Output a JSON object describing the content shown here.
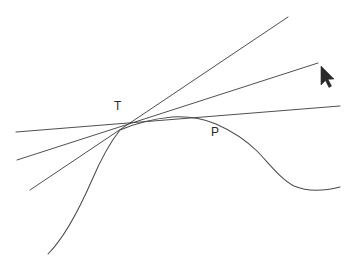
{
  "figure": {
    "background_color": "#ffffff",
    "stroke_color": "#3b3b3b",
    "curve_color": "#4a4a4a",
    "label_color": "#2a2a2a",
    "labels": {
      "tangent_point": "T",
      "secant_point": "P"
    },
    "points": {
      "T": {
        "x": 120,
        "y": 130
      },
      "P": {
        "x": 212,
        "y": 120
      }
    },
    "lines": [
      {
        "name": "steep-secant-line",
        "x1": 30,
        "y1": 190,
        "x2": 288,
        "y2": 17
      },
      {
        "name": "middle-secant-line",
        "x1": 17,
        "y1": 160,
        "x2": 318,
        "y2": 63
      },
      {
        "name": "tangent-line",
        "x1": 16,
        "y1": 132,
        "x2": 340,
        "y2": 106
      }
    ],
    "curve": {
      "name": "function-curve",
      "path": "M 48 254 C 62 240 78 212 92 180 C 104 152 112 140 120 130 C 134 124 152 119 172 117 C 190 116 204 119 216 124 C 232 131 246 140 258 152 C 272 167 282 180 294 186 C 308 192 324 191 340 187"
    },
    "cursor": {
      "name": "mouse-pointer",
      "x": 322,
      "y": 68,
      "direction": "up-left"
    }
  }
}
